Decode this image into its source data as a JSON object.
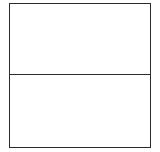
{
  "document": {
    "background_color": "#ffffff",
    "line_color": "#2b2b2b"
  },
  "table": {
    "name": "blank-two-row-table",
    "border_color": "#2b2b2b",
    "background_color": "#ffffff",
    "row_count": 2,
    "column_count": 1,
    "rows": [
      {
        "index": 1,
        "name": "top-row",
        "text": ""
      },
      {
        "index": 2,
        "name": "bottom-row",
        "text": ""
      }
    ]
  }
}
